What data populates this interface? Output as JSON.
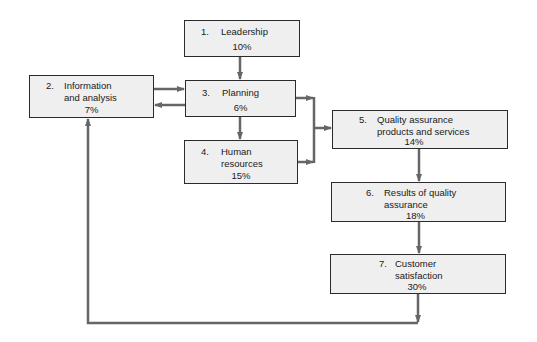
{
  "diagram": {
    "type": "flowchart",
    "colors": {
      "box_fill": "#efefef",
      "box_border": "#2b2b2b",
      "arrow": "#666666"
    },
    "nodes": [
      {
        "id": 1,
        "num": "1.",
        "label": "Leadership",
        "pct": "10%"
      },
      {
        "id": 2,
        "num": "2.",
        "label": "Information\nand analysis",
        "pct": "7%"
      },
      {
        "id": 3,
        "num": "3.",
        "label": "Planning",
        "pct": "6%"
      },
      {
        "id": 4,
        "num": "4.",
        "label": "Human\nresources",
        "pct": "15%"
      },
      {
        "id": 5,
        "num": "5.",
        "label": "Quality assurance\nproducts and services",
        "pct": "14%"
      },
      {
        "id": 6,
        "num": "6.",
        "label": "Results of quality\nassurance",
        "pct": "18%"
      },
      {
        "id": 7,
        "num": "7.",
        "label": "Customer\nsatisfaction",
        "pct": "30%"
      }
    ],
    "edges": [
      {
        "from": 1,
        "to": 3
      },
      {
        "from": 2,
        "to": 3
      },
      {
        "from": 3,
        "to": 2
      },
      {
        "from": 3,
        "to": 4
      },
      {
        "from": 3,
        "to": 5
      },
      {
        "from": 4,
        "to": 5
      },
      {
        "from": 5,
        "to": 6
      },
      {
        "from": 6,
        "to": 7
      },
      {
        "from": 7,
        "to": 2
      }
    ]
  }
}
